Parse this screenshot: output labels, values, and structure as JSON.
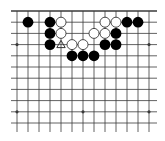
{
  "board": {
    "title": "Go board position (partial view, top edge)",
    "columns": 13,
    "rows": 11,
    "origin": {
      "x": 17,
      "y": 11
    },
    "spacing_x": 11,
    "spacing_y": 11.2,
    "top_edge": true,
    "extends_left": true,
    "extends_right": true,
    "extends_bottom": true,
    "colors": {
      "background": "#ffffff",
      "line": "#3a3a3a",
      "black_stone": "#000000",
      "white_stone": "#ffffff",
      "white_stone_border": "#222222",
      "marker": "#333333"
    },
    "star_points": [
      {
        "col": 0,
        "row": 3
      },
      {
        "col": 6,
        "row": 3
      },
      {
        "col": 12,
        "row": 3
      },
      {
        "col": 0,
        "row": 9
      },
      {
        "col": 6,
        "row": 9
      },
      {
        "col": 12,
        "row": 9
      }
    ],
    "stones": [
      {
        "color": "black",
        "col": 1,
        "row": 1
      },
      {
        "color": "black",
        "col": 3,
        "row": 1
      },
      {
        "color": "white",
        "col": 4,
        "row": 1
      },
      {
        "color": "white",
        "col": 8,
        "row": 1
      },
      {
        "color": "white",
        "col": 9,
        "row": 1
      },
      {
        "color": "black",
        "col": 10,
        "row": 1
      },
      {
        "color": "black",
        "col": 11,
        "row": 1
      },
      {
        "color": "black",
        "col": 3,
        "row": 2
      },
      {
        "color": "white",
        "col": 4,
        "row": 2
      },
      {
        "color": "white",
        "col": 7,
        "row": 2
      },
      {
        "color": "white",
        "col": 8,
        "row": 2
      },
      {
        "color": "black",
        "col": 9,
        "row": 2
      },
      {
        "color": "black",
        "col": 3,
        "row": 3
      },
      {
        "color": "white",
        "col": 5,
        "row": 3
      },
      {
        "color": "white",
        "col": 6,
        "row": 3
      },
      {
        "color": "black",
        "col": 8,
        "row": 3
      },
      {
        "color": "black",
        "col": 9,
        "row": 3
      },
      {
        "color": "black",
        "col": 5,
        "row": 4
      },
      {
        "color": "black",
        "col": 6,
        "row": 4
      },
      {
        "color": "black",
        "col": 7,
        "row": 4
      }
    ],
    "markers": [
      {
        "type": "triangle",
        "col": 4,
        "row": 3
      }
    ]
  }
}
